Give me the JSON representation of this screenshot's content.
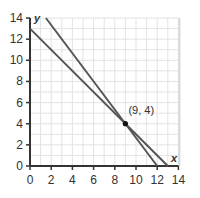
{
  "chart_data": {
    "type": "line",
    "title": "",
    "xlabel": "x",
    "ylabel": "y",
    "xlim": [
      0,
      14
    ],
    "ylim": [
      0,
      14
    ],
    "x_ticks": [
      0,
      2,
      4,
      6,
      8,
      10,
      12,
      14
    ],
    "y_ticks": [
      0,
      2,
      4,
      6,
      8,
      10,
      12,
      14
    ],
    "grid": true,
    "legend": null,
    "series": [
      {
        "name": "line-1",
        "equation": "y = 13 - x",
        "points": [
          [
            0,
            13
          ],
          [
            13,
            0
          ]
        ]
      },
      {
        "name": "line-2",
        "equation": "y = 16 - (4/3)x",
        "points": [
          [
            1.5,
            14
          ],
          [
            12,
            0
          ]
        ]
      }
    ],
    "annotations": [
      {
        "label": "(9, 4)",
        "x": 9,
        "y": 4,
        "marker": "point"
      }
    ],
    "colors": {
      "lines": "#555555",
      "axes": "#333333",
      "grid": "#e3e3e3"
    }
  },
  "labels": {
    "x_axis": "x",
    "y_axis": "y",
    "point": "(9, 4)",
    "x_ticks": [
      "0",
      "2",
      "4",
      "6",
      "8",
      "10",
      "12",
      "14"
    ],
    "y_ticks": [
      "0",
      "2",
      "4",
      "6",
      "8",
      "10",
      "12",
      "14"
    ]
  }
}
